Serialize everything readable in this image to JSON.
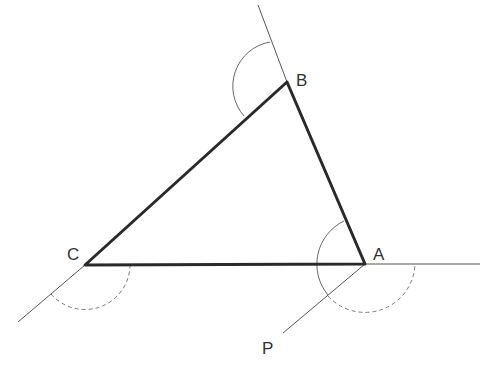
{
  "diagram": {
    "colors": {
      "background": "#ffffff",
      "triangle_edge": "#2a2a2a",
      "extension_line": "#555555",
      "arc": "#666666",
      "label": "#333333"
    },
    "vertices": {
      "A": {
        "label": "A",
        "x": 365,
        "y": 264
      },
      "B": {
        "label": "B",
        "x": 287,
        "y": 82
      },
      "C": {
        "label": "C",
        "x": 85,
        "y": 265
      }
    },
    "points": {
      "P": {
        "label": "P",
        "x": 283,
        "y": 333
      }
    },
    "triangle_edges": [
      "AB",
      "BC",
      "CA"
    ],
    "extension_lines": [
      {
        "from": "B",
        "to_x": 258,
        "to_y": 5,
        "description": "extension of CB beyond B"
      },
      {
        "from": "A",
        "to_x": 480,
        "to_y": 264,
        "description": "extension of CA beyond A"
      },
      {
        "from": "C",
        "to_x": 18,
        "to_y": 322,
        "description": "extension of BC beyond C"
      },
      {
        "from": "A",
        "to": "P",
        "description": "segment AP parallel to BC"
      }
    ],
    "angle_arcs": [
      {
        "vertex": "B",
        "style": "solid",
        "radius": 45,
        "description": "exterior angle at B"
      },
      {
        "vertex": "A",
        "style": "solid",
        "radius": 48,
        "description": "angle between AB and AP"
      },
      {
        "vertex": "A",
        "style": "dashed",
        "radius": 50,
        "description": "angle between AP and extension of CA"
      },
      {
        "vertex": "C",
        "style": "dashed",
        "radius": 45,
        "description": "exterior angle at C"
      }
    ],
    "labels": {
      "A": "A",
      "B": "B",
      "C": "C",
      "P": "P"
    }
  }
}
